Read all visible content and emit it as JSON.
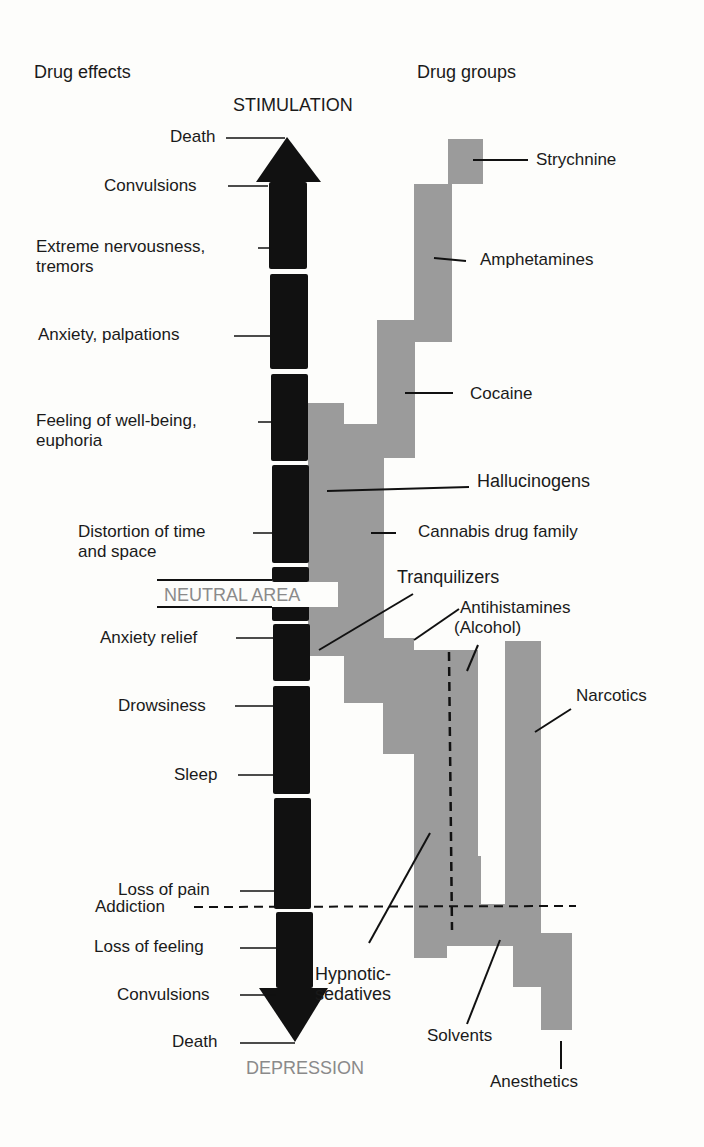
{
  "headers": {
    "left": "Drug effects",
    "right": "Drug groups"
  },
  "axis": {
    "top": "STIMULATION",
    "neutral": "NEUTRAL AREA",
    "bottom": "DEPRESSION",
    "addiction": "Addiction"
  },
  "effects": [
    {
      "label": "Death"
    },
    {
      "label": "Convulsions"
    },
    {
      "label": "Extreme nervousness,",
      "label2": "tremors"
    },
    {
      "label": "Anxiety, palpations"
    },
    {
      "label": "Feeling of well-being,",
      "label2": "euphoria"
    },
    {
      "label": "Distortion of time",
      "label2": "and space"
    },
    {
      "label": "Anxiety relief"
    },
    {
      "label": "Drowsiness"
    },
    {
      "label": "Sleep"
    },
    {
      "label": "Loss of pain"
    },
    {
      "label": "Loss of feeling"
    },
    {
      "label": "Convulsions"
    },
    {
      "label": "Death"
    }
  ],
  "groups": [
    {
      "label": "Strychnine"
    },
    {
      "label": "Amphetamines"
    },
    {
      "label": "Cocaine"
    },
    {
      "label": "Hallucinogens"
    },
    {
      "label": "Cannabis drug family"
    },
    {
      "label": "Tranquilizers"
    },
    {
      "label": "Antihistamines",
      "label2": "(Alcohol)"
    },
    {
      "label": "Narcotics"
    },
    {
      "label": "Hypnotic-",
      "label2": "sedatives"
    },
    {
      "label": "Solvents"
    },
    {
      "label": "Anesthetics"
    }
  ],
  "colors": {
    "arrow": "#111111",
    "drug_range": "#9b9b9b",
    "neutral_text": "#8a8a8a",
    "background": "#fdfdfb"
  }
}
